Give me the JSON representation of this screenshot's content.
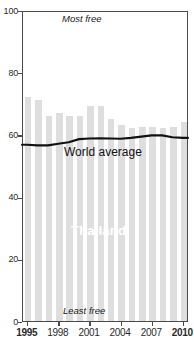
{
  "chart_data": {
    "type": "bar",
    "title": "",
    "xlabel": "",
    "ylabel": "",
    "ylim": [
      0,
      100
    ],
    "xlim": [
      1995,
      2010
    ],
    "grid": false,
    "legend_position": "inline-annotations",
    "categories": [
      "1995",
      "1996",
      "1997",
      "1998",
      "1999",
      "2000",
      "2001",
      "2002",
      "2003",
      "2004",
      "2005",
      "2006",
      "2007",
      "2008",
      "2009",
      "2010"
    ],
    "series": [
      {
        "name": "Thailand",
        "type": "bar",
        "color": "#dedede",
        "values": [
          72,
          71,
          66,
          67,
          66,
          66,
          69,
          69,
          65,
          63,
          62,
          62.5,
          62.5,
          62,
          62.5,
          64
        ]
      },
      {
        "name": "World average",
        "type": "line",
        "color": "#111111",
        "values": [
          57,
          56.8,
          56.8,
          57.3,
          57.8,
          58.8,
          59,
          59.1,
          59,
          58.9,
          59.2,
          59.6,
          60,
          60,
          59.4,
          59.2
        ]
      }
    ],
    "y_ticks": [
      0,
      20,
      40,
      60,
      80,
      100
    ],
    "y_tick_labels": [
      "0",
      "20",
      "40",
      "60",
      "80",
      "100"
    ],
    "x_ticks": [
      1995,
      1998,
      2001,
      2004,
      2007,
      2010
    ],
    "x_tick_labels": [
      "1995",
      "1998",
      "2001",
      "2004",
      "2007",
      "2010"
    ],
    "x_tick_bold": [
      true,
      false,
      false,
      false,
      false,
      true
    ],
    "annotations": [
      {
        "name": "most-free",
        "text": "Most free"
      },
      {
        "name": "least-free",
        "text": "Least free"
      },
      {
        "name": "world-average",
        "text": "World average"
      },
      {
        "name": "country",
        "text": "Thailand"
      }
    ]
  },
  "labels": {
    "most_free": "Most free",
    "least_free": "Least free",
    "world_average": "World average",
    "country": "Thailand"
  },
  "colors": {
    "bar": "#dedede",
    "line": "#111111",
    "axis": "#4a4a4a",
    "text": "#1a1a1a",
    "country_label": "#ffffff"
  }
}
